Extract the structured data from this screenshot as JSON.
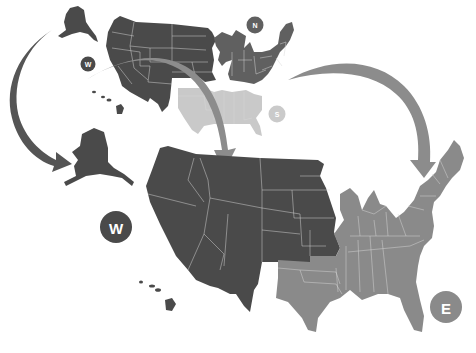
{
  "diagram": {
    "title": "",
    "colors": {
      "west": "#4a4a4a",
      "north": "#606060",
      "south": "#c9c9c9",
      "east": "#8a8a8a",
      "arrow_west": "#555555",
      "arrow_east": "#8c8c8c",
      "state_border": "#d8d8d8",
      "badge_text": "#ffffff"
    },
    "top_map": {
      "regions": [
        {
          "id": "west",
          "label": "W"
        },
        {
          "id": "north",
          "label": "N"
        },
        {
          "id": "south",
          "label": "S"
        }
      ]
    },
    "bottom_map": {
      "regions": [
        {
          "id": "west",
          "label": "W"
        },
        {
          "id": "east",
          "label": "E"
        }
      ]
    },
    "badges": {
      "top_w": "W",
      "top_n": "N",
      "top_s": "S",
      "bottom_w": "W",
      "bottom_e": "E"
    },
    "arrows": [
      {
        "from": "top-alaska",
        "to": "bottom-alaska",
        "direction": "curved-down-left"
      },
      {
        "from": "top-north",
        "to": "bottom-east",
        "direction": "curved-down-right"
      }
    ]
  }
}
